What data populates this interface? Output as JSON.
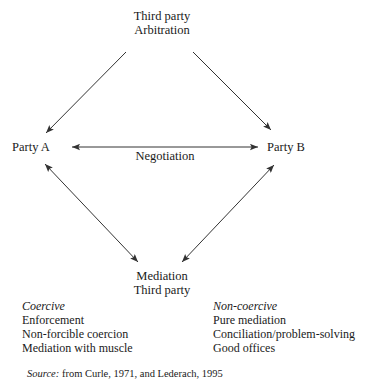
{
  "figure": {
    "type": "conflict-resolution-diamond",
    "background_color": "#ffffff",
    "line_color": "#333333",
    "text_color": "#1a1a1a"
  },
  "nodes": {
    "top": {
      "line1": "Third party",
      "line2": "Arbitration"
    },
    "left": {
      "label": "Party A"
    },
    "right": {
      "label": "Party B"
    },
    "bottom": {
      "line1": "Mediation",
      "line2": "Third party"
    }
  },
  "edges": {
    "negotiation_label": "Negotiation"
  },
  "categories": {
    "coercive": {
      "heading": "Coercive",
      "items": [
        "Enforcement",
        "Non-forcible coercion",
        "Mediation with muscle"
      ]
    },
    "non_coercive": {
      "heading": "Non-coercive",
      "items": [
        "Pure mediation",
        "Conciliation/problem-solving",
        "Good offices"
      ]
    }
  },
  "source": {
    "label": "Source:",
    "text": "from Curle, 1971, and Lederach, 1995"
  }
}
